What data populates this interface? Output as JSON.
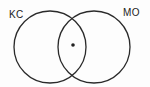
{
  "diagram": {
    "type": "venn",
    "sets": [
      {
        "label": "KC",
        "cx": 50,
        "cy": 47,
        "r": 36
      },
      {
        "label": "MO",
        "cx": 94,
        "cy": 47,
        "r": 36
      }
    ],
    "marker": {
      "symbol": "*",
      "cx": 73,
      "cy": 45,
      "region": "intersection"
    },
    "colors": {
      "stroke": "#2a2a2a",
      "text": "#222222",
      "background": "#fdfdfd"
    }
  }
}
